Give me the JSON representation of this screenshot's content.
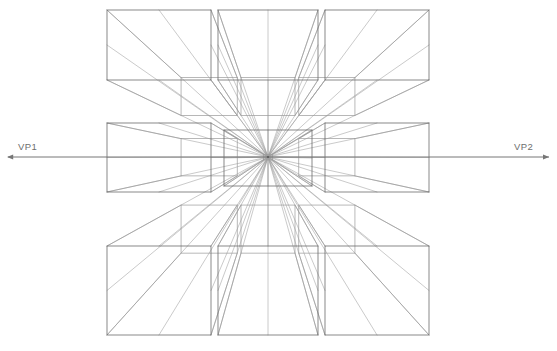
{
  "diagram": {
    "type": "perspective-construction",
    "canvas": {
      "width": 557,
      "height": 351,
      "background": "#ffffff"
    },
    "colors": {
      "near_edge": "#6b6b6b",
      "far_edge": "#9a9a9a",
      "convergence_ray": "#9d9d9d",
      "horizon": "#767676",
      "label_text": "#6e6e6e"
    },
    "stroke_widths": {
      "near_edge": 0.8,
      "far_edge": 0.7,
      "convergence_ray": 0.55,
      "horizon": 1.0
    },
    "vanishing_point": {
      "x": 268,
      "y": 157,
      "label": "central vanishing point"
    },
    "horizon_line": {
      "y": 157,
      "x_start": 8,
      "x_end": 549,
      "left_arrow": true,
      "right_arrow": true
    },
    "labels": {
      "left": {
        "text": "VP1",
        "x": 18,
        "y": 150
      },
      "right": {
        "text": "VP2",
        "x": 514,
        "y": 150
      }
    },
    "grid": {
      "rows": 3,
      "cols": 3,
      "description": "Nine rectangular boxes arranged around the vanishing point, each drawn in one-point perspective."
    },
    "boxes": [
      {
        "name": "top-left",
        "x": 107,
        "y": 10,
        "w": 104,
        "h": 70,
        "depth": 0.46,
        "order": 1
      },
      {
        "name": "top-middle",
        "x": 218,
        "y": 10,
        "w": 100,
        "h": 70,
        "depth": 0.46,
        "order": 2
      },
      {
        "name": "top-right",
        "x": 325,
        "y": 10,
        "w": 104,
        "h": 70,
        "depth": 0.46,
        "order": 3
      },
      {
        "name": "middle-left",
        "x": 107,
        "y": 123,
        "w": 104,
        "h": 69,
        "depth": 0.46,
        "order": 4
      },
      {
        "name": "center",
        "x": 224,
        "y": 130,
        "w": 88,
        "h": 56,
        "depth": 0.9,
        "order": 5
      },
      {
        "name": "middle-right",
        "x": 325,
        "y": 123,
        "w": 104,
        "h": 69,
        "depth": 0.46,
        "order": 6
      },
      {
        "name": "bottom-left",
        "x": 107,
        "y": 246,
        "w": 104,
        "h": 89,
        "depth": 0.46,
        "order": 7
      },
      {
        "name": "bottom-middle",
        "x": 218,
        "y": 246,
        "w": 100,
        "h": 89,
        "depth": 0.46,
        "order": 8
      },
      {
        "name": "bottom-right",
        "x": 325,
        "y": 246,
        "w": 104,
        "h": 89,
        "depth": 0.46,
        "order": 9
      }
    ]
  }
}
